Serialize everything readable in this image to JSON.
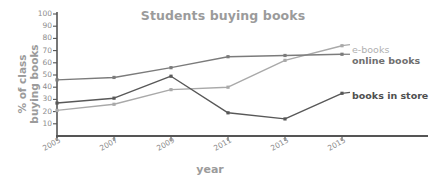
{
  "chart_data": {
    "type": "line",
    "title": "Students buying books",
    "xlabel": "year",
    "ylabel_line1": "% of class",
    "ylabel_line2": "buying books",
    "categories": [
      "2005",
      "2007",
      "2009",
      "2011",
      "2013",
      "2015"
    ],
    "x": [
      2005,
      2007,
      2009,
      2011,
      2013,
      2015
    ],
    "ylim": [
      0,
      100
    ],
    "yticks": [
      100,
      90,
      80,
      70,
      60,
      50,
      40,
      30,
      20,
      10
    ],
    "grid": false,
    "legend_position": "right",
    "series": [
      {
        "name": "e-books",
        "color": "#a9a9a9",
        "values": [
          21,
          26,
          38,
          40,
          62,
          74
        ]
      },
      {
        "name": "online books",
        "color": "#7b7b7b",
        "values": [
          46,
          48,
          56,
          65,
          66,
          67
        ]
      },
      {
        "name": "books in store",
        "color": "#585858",
        "values": [
          27,
          31,
          49,
          19,
          14,
          35
        ]
      }
    ]
  },
  "legend": {
    "ebooks_label": "e-books",
    "online_label": "online books",
    "store_label": "books in store"
  },
  "axis": {
    "y_ticks": [
      "100",
      "90",
      "80",
      "70",
      "60",
      "50",
      "40",
      "30",
      "20",
      "10"
    ],
    "x_ticks": [
      "2005",
      "2007",
      "2009",
      "2011",
      "2013",
      "2015"
    ]
  },
  "colors": {
    "ebooks": "#a9a9a9",
    "online": "#7b7b7b",
    "store": "#585858",
    "axis": "#555555",
    "text": "#9b9b9b"
  }
}
